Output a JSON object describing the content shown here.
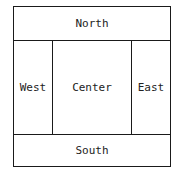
{
  "diagram": {
    "type": "border-layout",
    "regions": {
      "north": {
        "label": "North"
      },
      "west": {
        "label": "West"
      },
      "center": {
        "label": "Center"
      },
      "east": {
        "label": "East"
      },
      "south": {
        "label": "South"
      }
    }
  }
}
